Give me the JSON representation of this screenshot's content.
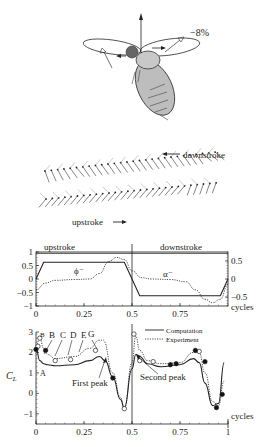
{
  "illustration": {
    "label_percent": "−8%",
    "downstroke_label": "downstroke",
    "upstroke_label": "upstroke"
  },
  "chart_data": [
    {
      "type": "line",
      "title": "",
      "xlabel": "cycles",
      "ylabel": "",
      "xlim": [
        0,
        1
      ],
      "ylim_left": [
        -1,
        1
      ],
      "ylim_right": [
        -0.75,
        0.75
      ],
      "x_ticks": [
        "0",
        "0.25",
        "0.5",
        "0.75"
      ],
      "y_ticks_left": [
        "1",
        "0.5",
        "0",
        "−0.5",
        "−1"
      ],
      "y_ticks_right": [
        "0.5",
        "0",
        "−0.5"
      ],
      "annotations": {
        "upstroke": "upstroke",
        "downstroke": "downstroke",
        "phi": "ϕ⁻",
        "alpha": "α⁻",
        "divider_x": 0.5
      },
      "series": [
        {
          "name": "phi",
          "style": "solid",
          "x": [
            0,
            0.04,
            0.46,
            0.54,
            0.96,
            1.0
          ],
          "y": [
            0,
            0.62,
            0.62,
            -0.62,
            -0.62,
            0
          ]
        },
        {
          "name": "alpha",
          "style": "dotted",
          "x": [
            0,
            0.05,
            0.1,
            0.2,
            0.28,
            0.33,
            0.38,
            0.42,
            0.46,
            0.5,
            0.55,
            0.6,
            0.7,
            0.78,
            0.83,
            0.88,
            0.92,
            0.96,
            1.0
          ],
          "y": [
            -0.4,
            -0.15,
            -0.05,
            -0.02,
            0.0,
            0.2,
            0.65,
            0.8,
            0.72,
            0.3,
            0.05,
            0.0,
            -0.02,
            -0.1,
            -0.4,
            -0.75,
            -0.88,
            -0.75,
            -0.2
          ]
        }
      ]
    },
    {
      "type": "line",
      "title": "",
      "xlabel": "cycles",
      "ylabel": "C_L",
      "xlim": [
        0,
        1
      ],
      "ylim": [
        -1.5,
        3
      ],
      "x_ticks": [
        "0",
        "0.25",
        "0.5",
        "0.75",
        "1"
      ],
      "y_ticks": [
        "3",
        "2",
        "1",
        "0",
        "−1"
      ],
      "legend": {
        "placement": "top-right",
        "entries": [
          "Computation",
          "Experiment"
        ]
      },
      "annotations": {
        "A": "A",
        "B": "B",
        "C": "C",
        "D": "D",
        "E": "E",
        "G": "G",
        "first_peak": "First peak",
        "second_peak": "Second peak",
        "divider_x": 0.5
      },
      "series": [
        {
          "name": "Computation",
          "style": "solid",
          "x": [
            0,
            0.02,
            0.04,
            0.06,
            0.1,
            0.2,
            0.28,
            0.33,
            0.36,
            0.4,
            0.44,
            0.46,
            0.5,
            0.52,
            0.54,
            0.58,
            0.65,
            0.75,
            0.82,
            0.85,
            0.88,
            0.92,
            0.95,
            0.98
          ],
          "y": [
            2.2,
            1.6,
            1.45,
            1.4,
            1.35,
            1.4,
            1.6,
            1.8,
            1.6,
            0.8,
            -0.3,
            -0.7,
            1.2,
            1.9,
            1.8,
            1.45,
            1.3,
            1.4,
            1.7,
            1.5,
            0.5,
            -0.6,
            -0.5,
            1.5
          ]
        },
        {
          "name": "Experiment",
          "style": "dotted",
          "x": [
            0,
            0.02,
            0.04,
            0.06,
            0.1,
            0.2,
            0.28,
            0.33,
            0.35,
            0.4,
            0.44,
            0.46,
            0.5,
            0.52,
            0.54,
            0.58,
            0.65,
            0.75,
            0.82,
            0.85,
            0.88,
            0.92,
            0.95,
            0.98
          ],
          "y": [
            2.3,
            2.7,
            2.2,
            1.9,
            1.7,
            1.8,
            2.2,
            2.6,
            2.6,
            1.0,
            -0.2,
            -0.75,
            1.5,
            2.8,
            2.1,
            1.6,
            1.45,
            1.5,
            2.0,
            2.0,
            1.0,
            -0.4,
            -0.6,
            0.6
          ]
        },
        {
          "name": "open_markers",
          "style": "marker-open",
          "x": [
            0.01,
            0.02,
            0.1,
            0.18,
            0.31,
            0.46,
            0.51,
            0.54,
            0.61,
            0.85
          ],
          "y": [
            2.3,
            2.7,
            1.6,
            1.65,
            2.1,
            -0.75,
            2.9,
            1.6,
            1.55,
            2.05
          ]
        },
        {
          "name": "filled_markers",
          "style": "marker-filled",
          "x": [
            0.0,
            0.05,
            0.4,
            0.7,
            0.73,
            0.83,
            0.88,
            0.94,
            0.97
          ],
          "y": [
            2.15,
            2.1,
            0.75,
            1.4,
            1.45,
            2.1,
            1.55,
            -0.7,
            -0.05
          ]
        }
      ]
    }
  ]
}
